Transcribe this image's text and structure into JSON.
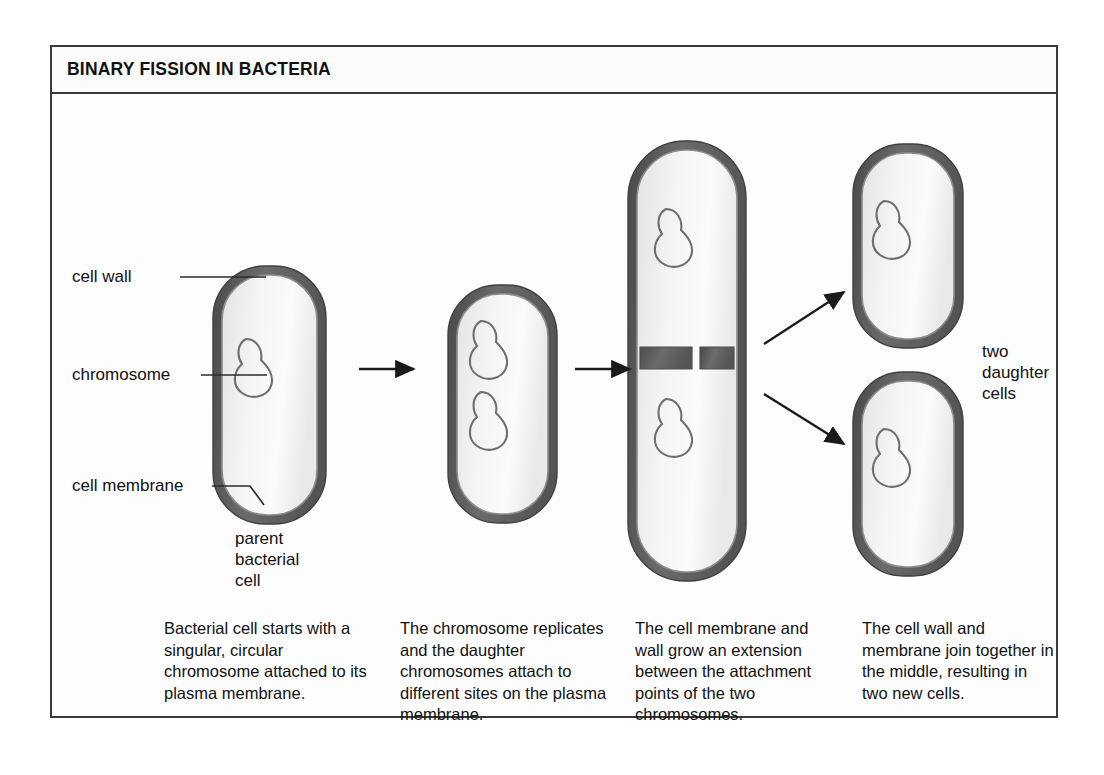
{
  "figure": {
    "title": "BINARY FISSION IN BACTERIA",
    "frame_color": "#3a3a3a",
    "background": "#fdfdfd"
  },
  "colors": {
    "cell_wall": "#5e5e5e",
    "cell_membrane": "#7a7a7a",
    "cytoplasm": "#efefef",
    "chromosome_outline": "#6e6e6e",
    "arrow": "#1a1a1a",
    "leader_line": "#2b2b2b",
    "text": "#111111"
  },
  "labels": {
    "cell_wall": "cell wall",
    "chromosome": "chromosome",
    "cell_membrane": "cell membrane",
    "parent_cell_line1": "parent",
    "parent_cell_line2": "bacterial",
    "parent_cell_line3": "cell",
    "daughter_line1": "two",
    "daughter_line2": "daughter",
    "daughter_line3": "cells"
  },
  "stages": [
    {
      "id": "stage-1",
      "name": "parent-bacterial-cell",
      "chromosome_count": 1,
      "caption": "Bacterial cell starts with a singular, circular chromosome attached to its plasma membrane."
    },
    {
      "id": "stage-2",
      "name": "chromosome-replicated-cell",
      "chromosome_count": 2,
      "caption": "The chromosome replicates and the daughter chromosomes attach to different sites on the plasma membrane."
    },
    {
      "id": "stage-3",
      "name": "elongating-cell-with-septum",
      "chromosome_count": 2,
      "caption": "The cell membrane and wall grow an extension between the attachment points of the two chromosomes."
    },
    {
      "id": "stage-4",
      "name": "two-daughter-cells",
      "chromosome_count": 2,
      "caption": "The cell wall and membrane join together in the middle, resulting in two new cells."
    }
  ],
  "arrows": [
    {
      "name": "arrow-stage1-to-stage2",
      "direction": "right"
    },
    {
      "name": "arrow-stage2-to-stage3",
      "direction": "right"
    },
    {
      "name": "arrow-stage3-to-daughter-top",
      "direction": "up-right"
    },
    {
      "name": "arrow-stage3-to-daughter-bottom",
      "direction": "down-right"
    }
  ]
}
